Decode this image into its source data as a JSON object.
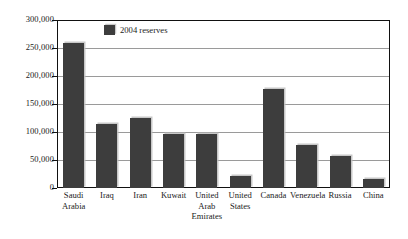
{
  "chart_data": {
    "type": "bar",
    "title": "",
    "subtitle": "",
    "xlabel": "",
    "ylabel": "",
    "categories": [
      "Saudi Arabia",
      "Iraq",
      "Iran",
      "Kuwait",
      "United Arab Emirates",
      "United States",
      "Canada",
      "Venezuela",
      "Russia",
      "China"
    ],
    "category_label_lines": [
      [
        "Saudi",
        "Arabia"
      ],
      [
        "Iraq"
      ],
      [
        "Iran"
      ],
      [
        "Kuwait"
      ],
      [
        "United",
        "Arab",
        "Emirates"
      ],
      [
        "United",
        "States"
      ],
      [
        "Canada"
      ],
      [
        "Venezuela"
      ],
      [
        "Russia"
      ],
      [
        "China"
      ]
    ],
    "series": [
      {
        "name": "2004 reserves",
        "color": "#3d3d3d",
        "values": [
          259000,
          114000,
          125000,
          97000,
          96500,
          21000,
          177000,
          77000,
          58000,
          16000
        ]
      }
    ],
    "ylim": [
      0,
      300000
    ],
    "yticks": [
      0,
      50000,
      100000,
      150000,
      200000,
      250000,
      300000
    ],
    "ytick_labels": [
      "0",
      "50,000",
      "100,000",
      "150,000",
      "200,000",
      "250,000",
      "300,000"
    ],
    "grid": true,
    "grid_axis": "y",
    "legend": {
      "position": "top-left-inside",
      "entries": [
        {
          "label": "2004 reserves",
          "color": "#3d3d3d"
        }
      ]
    },
    "frame_color": "#111111",
    "gridline_color": "#9a9a9a",
    "background": "#ffffff"
  }
}
